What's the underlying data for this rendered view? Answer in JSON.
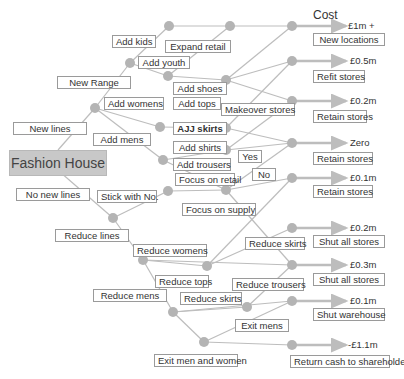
{
  "title": "Fashion House",
  "cost_header": "Cost",
  "colors": {
    "edge": "#b8b8b8",
    "node": "#b4b4b4",
    "arrow": "#bdbdbd",
    "root_fill": "#c8c8c8"
  },
  "labels": {
    "new_lines": "New lines",
    "no_new_lines": "No new lines",
    "new_range": "New Range",
    "add_kids": "Add kids",
    "add_youth": "Add youth",
    "expand_retail": "Expand retail",
    "add_womens": "Add womens",
    "add_mens": "Add mens",
    "add_shoes": "Add shoes",
    "add_tops": "Add tops",
    "add_skirts": "AJJ skirts",
    "add_shirts": "Add shirts",
    "add_trousers": "Add trousers",
    "makeover_stores": "Makeover stores",
    "yes": "Yes",
    "no": "No",
    "focus_on_retail": "Focus on retail",
    "focus_on_supply": "Focus on supply",
    "stick_with_no": "Stick with No.",
    "reduce_lines": "Reduce lines",
    "reduce_womens": "Reduce womens",
    "reduce_skirts_1": "Reduce skirts",
    "reduce_tops": "Reduce tops",
    "reduce_trousers": "Reduce trousers",
    "reduce_mens": "Reduce mens",
    "reduce_skirts_2": "Reduce skirts",
    "exit_mens": "Exit mens",
    "exit_men_and_women": "Exit men and women"
  },
  "outcomes": [
    {
      "cost": "£1m +",
      "action": "New locations"
    },
    {
      "cost": "£0.5m",
      "action": "Refit stores"
    },
    {
      "cost": "£0.2m",
      "action": "Retain stores"
    },
    {
      "cost": "Zero",
      "action": "Retain stores"
    },
    {
      "cost": "£0.1m",
      "action": "Retain stores"
    },
    {
      "cost": "£0.2m",
      "action": "Shut all stores"
    },
    {
      "cost": "£0.3m",
      "action": "Shut all stores"
    },
    {
      "cost": "£0.1m",
      "action": "Shut warehouse"
    },
    {
      "cost": "-£1.1m",
      "action": "Return cash to shareholders"
    }
  ]
}
